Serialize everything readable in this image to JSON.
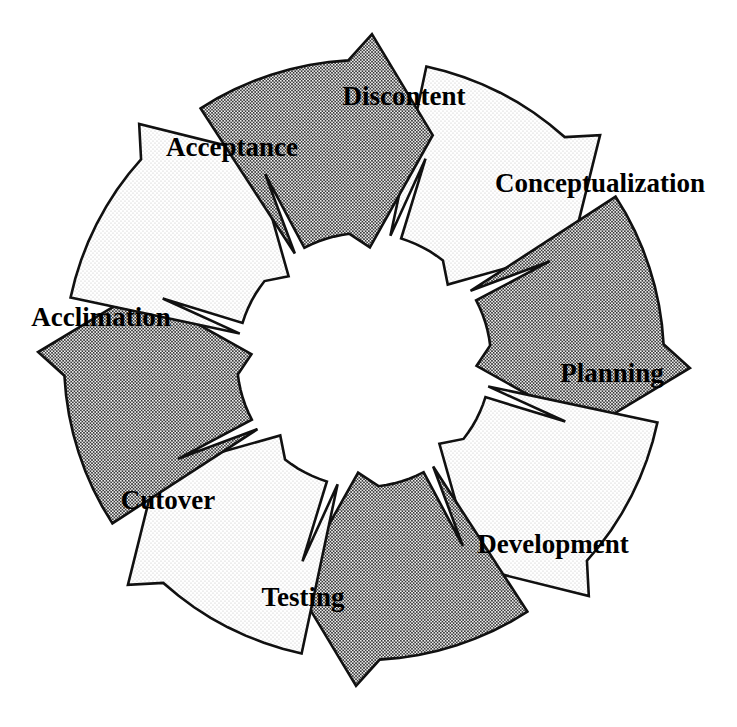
{
  "diagram": {
    "type": "cycle",
    "shape": "circular-arrow-ring",
    "segment_count": 8,
    "direction": "clockwise",
    "geometry": {
      "center_x": 364,
      "center_y": 360,
      "outer_radius": 300,
      "inner_radius": 127,
      "tip_overshoot": 26,
      "tail_notch_depth": 30
    },
    "style": {
      "fill_light": "#f2f2f2",
      "fill_dark": "#d9d9d9",
      "stipple_light": "#b8b8b8",
      "stipple_dark": "#2b2b2b",
      "stroke": "#111111",
      "background": "#ffffff",
      "text_color": "#000000"
    },
    "segments": [
      {
        "id": "discontent",
        "label": "Discontent",
        "order": 1,
        "fill": "light",
        "start_angle": -78,
        "end_angle": -28,
        "label_x": 404,
        "label_y": 99,
        "label_anchor": "middle",
        "label_rotation": 0
      },
      {
        "id": "conceptualization",
        "label": "Conceptualization",
        "order": 2,
        "fill": "dark",
        "start_angle": -33,
        "end_angle": 17,
        "label_x": 600,
        "label_y": 186,
        "label_anchor": "middle",
        "label_rotation": 0
      },
      {
        "id": "planning",
        "label": "Planning",
        "order": 3,
        "fill": "light",
        "start_angle": 12,
        "end_angle": 62,
        "label_x": 612,
        "label_y": 376,
        "label_anchor": "middle",
        "label_rotation": 0
      },
      {
        "id": "development",
        "label": "Development",
        "order": 4,
        "fill": "dark",
        "start_angle": 57,
        "end_angle": 107,
        "label_x": 553,
        "label_y": 547,
        "label_anchor": "middle",
        "label_rotation": 0
      },
      {
        "id": "testing",
        "label": "Testing",
        "order": 5,
        "fill": "light",
        "start_angle": 102,
        "end_angle": 152,
        "label_x": 303,
        "label_y": 600,
        "label_anchor": "middle",
        "label_rotation": 0
      },
      {
        "id": "cutover",
        "label": "Cutover",
        "order": 6,
        "fill": "dark",
        "start_angle": 147,
        "end_angle": 197,
        "label_x": 168,
        "label_y": 503,
        "label_anchor": "middle",
        "label_rotation": 0
      },
      {
        "id": "acclimation",
        "label": "Acclimation",
        "order": 7,
        "fill": "light",
        "start_angle": 192,
        "end_angle": 242,
        "label_x": 101,
        "label_y": 320,
        "label_anchor": "middle",
        "label_rotation": 0
      },
      {
        "id": "acceptance",
        "label": "Acceptance",
        "order": 8,
        "fill": "dark",
        "start_angle": 237,
        "end_angle": 287,
        "label_x": 232,
        "label_y": 150,
        "label_anchor": "middle",
        "label_rotation": 0
      }
    ]
  }
}
